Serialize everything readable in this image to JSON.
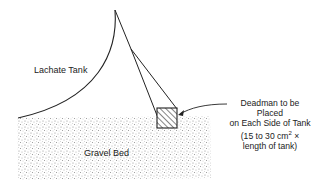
{
  "diagram": {
    "labels": {
      "tank": "Lachate Tank",
      "gravel": "Gravel Bed",
      "deadman": {
        "line1": "Deadman to be Placed",
        "line2": "on Each Side of Tank",
        "line3_prefix": "(15 to 30 cm",
        "line3_sup": "2",
        "line3_suffix": " ×",
        "line4": "length of tank)"
      }
    },
    "colors": {
      "line": "#222222",
      "gravel_fill": "#d9d9d9",
      "background": "#ffffff"
    }
  }
}
